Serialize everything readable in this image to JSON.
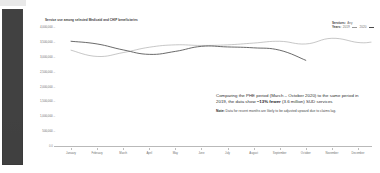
{
  "sidebar": {
    "name": "navigation-rail",
    "color": "#3d3d3d"
  },
  "chart": {
    "title": "Service use among selected Medicaid and CHIP beneficiaries"
  },
  "legend": {
    "services_key": "Services:",
    "services_value": "Any",
    "years_key": "Years:",
    "year_1_label": "2019",
    "year_2_label": "2020"
  },
  "annotation": {
    "main_part_1": "Comparing the PHE period (March – October 2020) to the same period in 2019, the data show ",
    "main_emphasis": "~13% fewer",
    "main_part_2": " (3.6 million) SUD services",
    "note_label": "Note:",
    "note_text": " Data for recent months are likely to be adjusted upward due to claims lag."
  },
  "axis": {
    "zero_label": "0.0"
  },
  "chart_data": {
    "type": "line",
    "title": "Service use among selected Medicaid and CHIP beneficiaries",
    "xlabel": "",
    "ylabel": "",
    "grid": false,
    "legend_position": "top-right",
    "ylim": [
      0,
      4000000
    ],
    "ytick_labels": [
      "4,000,000",
      "3,500,000",
      "3,000,000",
      "2,500,000",
      "2,000,000",
      "1,500,000",
      "1,000,000",
      "500,000"
    ],
    "ytick_values": [
      4000000,
      3500000,
      3000000,
      2500000,
      2000000,
      1500000,
      1000000,
      500000
    ],
    "categories": [
      "January",
      "February",
      "March",
      "April",
      "May",
      "June",
      "July",
      "August",
      "September",
      "October",
      "November",
      "December"
    ],
    "series": [
      {
        "name": "2019",
        "color": "#a8a8a8",
        "values": [
          3220000,
          3010000,
          3140000,
          3320000,
          3400000,
          3380000,
          3400000,
          3460000,
          3520000,
          3430000,
          3620000,
          3480000
        ],
        "values_extra": [
          3490000
        ]
      },
      {
        "name": "2020",
        "color": "#4f4f4f",
        "values": [
          3520000,
          3430000,
          3230000,
          3080000,
          3180000,
          3350000,
          3330000,
          3300000,
          3220000,
          2880000,
          null,
          null
        ]
      }
    ]
  }
}
